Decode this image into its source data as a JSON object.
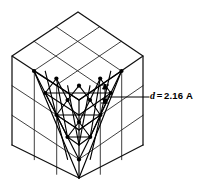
{
  "figure": {
    "background_color": "#ffffff",
    "line_color": "#1a1a1a",
    "atom_color": "#000000",
    "width": 212,
    "height": 186
  },
  "annotation": {
    "symbol": "d",
    "equals": "=",
    "value": "2.16",
    "unit": "A",
    "full_text": "d = 2.16 A"
  },
  "cube": {
    "description": "Isometric cube divided into a 3 by 3 grid of squares on each visible face",
    "grid_divisions": 3,
    "vertices": {
      "top": [
        78,
        12
      ],
      "left": [
        12,
        56
      ],
      "right": [
        143,
        56
      ],
      "center": [
        79,
        100
      ],
      "bottom_left": [
        12,
        145
      ],
      "bottom_right": [
        143,
        145
      ],
      "bottom": [
        79,
        178
      ]
    },
    "faces": [
      "top",
      "left",
      "front-right"
    ]
  },
  "lattice": {
    "description": "Close-packed triangular net of atoms on the (111) plane exposed across the two front faces",
    "rows": 5,
    "atoms_top_row": 5,
    "spacing_label": "d",
    "dimension_arrow": {
      "orientation": "vertical",
      "x": 105,
      "y_top": 85,
      "y_bottom": 103
    }
  },
  "leader_line": {
    "from": [
      105,
      97
    ],
    "to": [
      150,
      97
    ]
  }
}
